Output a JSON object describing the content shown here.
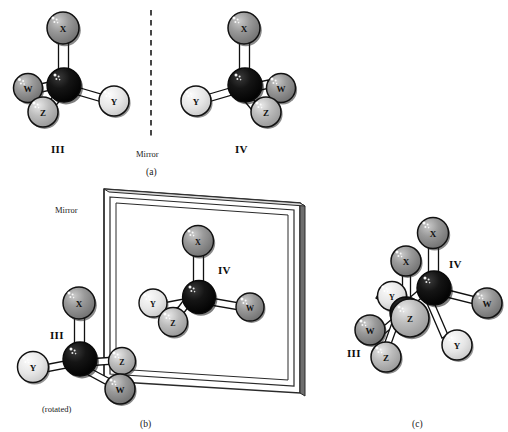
{
  "figure": {
    "panels": [
      {
        "id": "a",
        "caption": "(a)",
        "mirror_label": "Mirror",
        "mirror_type": "dashed-line",
        "molecules": [
          {
            "name": "III",
            "label": "III",
            "center_atom": "C",
            "substituents": [
              {
                "label": "X",
                "position": "top",
                "shade": "mid-gray"
              },
              {
                "label": "W",
                "position": "left",
                "shade": "mid-gray"
              },
              {
                "label": "Z",
                "position": "lower-left",
                "shade": "light-gray"
              },
              {
                "label": "Y",
                "position": "right",
                "shade": "near-white"
              }
            ]
          },
          {
            "name": "IV",
            "label": "IV",
            "center_atom": "C",
            "substituents": [
              {
                "label": "X",
                "position": "top",
                "shade": "mid-gray"
              },
              {
                "label": "Y",
                "position": "left",
                "shade": "near-white"
              },
              {
                "label": "W",
                "position": "right",
                "shade": "mid-gray"
              },
              {
                "label": "Z",
                "position": "lower-right",
                "shade": "light-gray"
              }
            ]
          }
        ]
      },
      {
        "id": "b",
        "caption": "(b)",
        "mirror_label": "Mirror",
        "mirror_type": "framed-plane",
        "rotated_note": "(rotated)",
        "molecules": [
          {
            "name": "III",
            "label": "III",
            "center_atom": "C",
            "substituents": [
              {
                "label": "X",
                "position": "top",
                "shade": "mid-gray"
              },
              {
                "label": "Y",
                "position": "left",
                "shade": "near-white"
              },
              {
                "label": "Z",
                "position": "right",
                "shade": "light-gray"
              },
              {
                "label": "W",
                "position": "lower-right",
                "shade": "mid-gray"
              }
            ]
          },
          {
            "name": "IV",
            "label": "IV",
            "center_atom": "C",
            "substituents": [
              {
                "label": "X",
                "position": "top",
                "shade": "mid-gray"
              },
              {
                "label": "Y",
                "position": "left",
                "shade": "near-white"
              },
              {
                "label": "Z",
                "position": "lower-left",
                "shade": "light-gray"
              },
              {
                "label": "W",
                "position": "right",
                "shade": "mid-gray"
              }
            ]
          }
        ]
      },
      {
        "id": "c",
        "caption": "(c)",
        "description": "III and IV superimposed to show non-superimposability",
        "molecules": [
          {
            "name": "IV",
            "label": "IV",
            "center_atom": "C",
            "substituents": [
              {
                "label": "X",
                "position": "top",
                "shade": "mid-gray"
              },
              {
                "label": "Z",
                "position": "lower-left",
                "shade": "light-gray"
              },
              {
                "label": "W",
                "position": "right",
                "shade": "mid-gray"
              },
              {
                "label": "Y",
                "position": "lower-right",
                "shade": "near-white"
              }
            ]
          },
          {
            "name": "III",
            "label": "III",
            "center_atom": "C",
            "substituents": [
              {
                "label": "X",
                "position": "upper-left",
                "shade": "mid-gray"
              },
              {
                "label": "Y",
                "position": "left",
                "shade": "near-white"
              },
              {
                "label": "W",
                "position": "lower-left",
                "shade": "mid-gray"
              },
              {
                "label": "Z",
                "position": "bottom",
                "shade": "light-gray"
              }
            ]
          }
        ]
      }
    ],
    "atom_shades": {
      "center_carbon": "#0a0a0a",
      "mid_gray": "#8a8a8a",
      "light_gray": "#b5b5b5",
      "near_white": "#e4e4e4",
      "outline": "#111111",
      "bond_fill": "#ffffff",
      "highlight": "#f2f2f2"
    },
    "mirror_frame": {
      "fill": "#ffffff",
      "edge": "#2a2a2a",
      "side_shade": "#6e6e6e"
    }
  }
}
